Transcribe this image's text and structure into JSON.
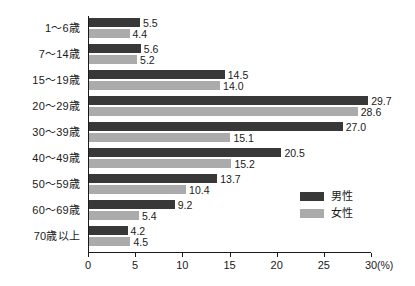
{
  "chart_data": {
    "type": "bar",
    "orientation": "horizontal",
    "title": "",
    "xlabel": "",
    "ylabel": "",
    "unit": "(%)",
    "xlim": [
      0,
      30
    ],
    "xticks": [
      0,
      5,
      10,
      15,
      20,
      25,
      30
    ],
    "xtick_labels": [
      "0",
      "5",
      "10",
      "15",
      "20",
      "25",
      "30"
    ],
    "grid": false,
    "legend_position": "middle-right",
    "categories": [
      "1〜6歳",
      "7〜14歳",
      "15〜19歳",
      "20〜29歳",
      "30〜39歳",
      "40〜49歳",
      "50〜59歳",
      "60〜69歳",
      "70歳以上"
    ],
    "series": [
      {
        "name": "男性",
        "color": "#383838",
        "values": [
          5.5,
          5.6,
          14.5,
          29.7,
          27.0,
          20.5,
          13.7,
          9.2,
          4.2
        ],
        "labels": [
          "5.5",
          "5.6",
          "14.5",
          "29.7",
          "27.0",
          "20.5",
          "13.7",
          "9.2",
          "4.2"
        ]
      },
      {
        "name": "女性",
        "color": "#ababab",
        "values": [
          4.4,
          5.2,
          14.0,
          28.6,
          15.1,
          15.2,
          10.4,
          5.4,
          4.5
        ],
        "labels": [
          "4.4",
          "5.2",
          "14.0",
          "28.6",
          "15.1",
          "15.2",
          "10.4",
          "5.4",
          "4.5"
        ]
      }
    ]
  },
  "legend": {
    "items": [
      {
        "label": "男性",
        "color": "#383838"
      },
      {
        "label": "女性",
        "color": "#ababab"
      }
    ]
  },
  "axis": {
    "unit_label": "(%)"
  }
}
